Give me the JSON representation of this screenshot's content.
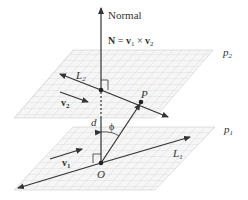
{
  "diagram": {
    "normal_label": "Normal",
    "cross_product": {
      "N": "N",
      "equals": " = ",
      "v1": "v",
      "v1_sub": "1",
      "times": " × ",
      "v2": "v",
      "v2_sub": "2"
    },
    "planes": [
      {
        "name": "p",
        "sub": "2",
        "position": "upper"
      },
      {
        "name": "p",
        "sub": "1",
        "position": "lower"
      }
    ],
    "lines": [
      {
        "name": "L",
        "sub": "2",
        "plane": "upper"
      },
      {
        "name": "L",
        "sub": "1",
        "plane": "lower"
      }
    ],
    "vectors": [
      {
        "name": "v",
        "sub": "2",
        "plane": "upper"
      },
      {
        "name": "v",
        "sub": "1",
        "plane": "lower"
      }
    ],
    "points": [
      {
        "label": "P"
      },
      {
        "label": "O"
      }
    ],
    "distance_label": "d",
    "angle_label": "ϕ",
    "colors": {
      "line": "#333333",
      "grid": "#c8c8c8",
      "plane_fill": "#f4f4f4",
      "text": "#333333"
    }
  }
}
